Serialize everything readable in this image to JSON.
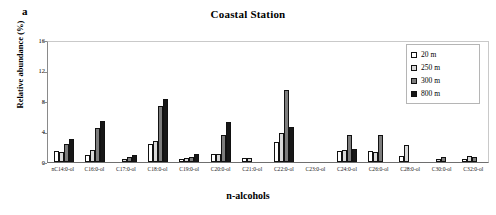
{
  "panel_label": "a",
  "chart_data": {
    "type": "bar",
    "title": "Coastal Station",
    "xlabel": "n-alcohols",
    "ylabel": "Relative abundance (%)",
    "ylim": [
      0,
      16
    ],
    "yticks": [
      0,
      4,
      8,
      12,
      16
    ],
    "grid": false,
    "legend_position": "top-right",
    "categories": [
      "nC14:0-ol",
      "C16:0-ol",
      "C17:0-ol",
      "C18:0-ol",
      "C19:0-ol",
      "C20:0-ol",
      "C21:0-ol",
      "C22:0-ol",
      "C23:0-ol",
      "C24:0-ol",
      "C26:0-ol",
      "C28:0-ol",
      "C30:0-ol",
      "C32:0-ol"
    ],
    "series": [
      {
        "name": "20 m",
        "color": "#ffffff",
        "values": [
          1.5,
          0.9,
          0.0,
          2.4,
          0.35,
          1.0,
          0.5,
          2.6,
          0.0,
          1.4,
          1.4,
          0.8,
          0.0,
          0.45
        ]
      },
      {
        "name": "250 m",
        "color": "#d9d9d9",
        "values": [
          1.3,
          1.6,
          0.4,
          2.7,
          0.55,
          1.1,
          0.55,
          3.8,
          0.0,
          1.6,
          1.3,
          2.2,
          0.45,
          0.8
        ]
      },
      {
        "name": "300 m",
        "color": "#7d7d7d",
        "values": [
          2.4,
          4.5,
          0.6,
          7.3,
          0.65,
          3.5,
          0.0,
          9.4,
          0.0,
          3.5,
          3.5,
          0.0,
          0.6,
          0.6
        ]
      },
      {
        "name": "800 m",
        "color": "#171717",
        "values": [
          3.0,
          5.4,
          0.95,
          8.2,
          1.0,
          5.2,
          0.0,
          4.6,
          0.0,
          1.7,
          0.0,
          0.0,
          0.0,
          0.0
        ]
      }
    ]
  }
}
